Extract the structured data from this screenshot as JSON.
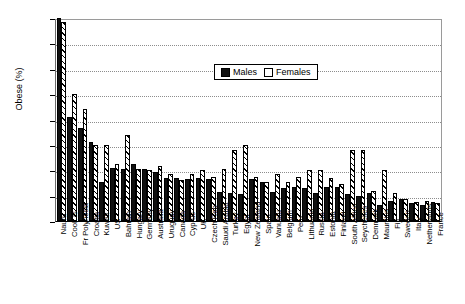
{
  "chart_data": {
    "type": "bar",
    "title": "",
    "xlabel": "",
    "ylabel": "Obese (%)",
    "ylim": [
      0,
      80
    ],
    "yticks": [
      0,
      10,
      20,
      30,
      40,
      50,
      60,
      70,
      80
    ],
    "grid": true,
    "legend_position": "top-center",
    "categories": [
      "Nauru",
      "Cook Is",
      "Fr Polynesia",
      "Croatia",
      "Kuwait",
      "US",
      "Bahrain",
      "Hungary",
      "Germany",
      "Australia",
      "Uruguay",
      "Canada",
      "Cyprus",
      "UK",
      "Czech Rep",
      "Saudi Arabia",
      "Turkey",
      "Egypt",
      "New Zealand",
      "Spain",
      "Vanuatu",
      "Belgium",
      "Peru",
      "Lithuania",
      "Russia",
      "Estonia",
      "Finland",
      "South Africa",
      "Seychelles",
      "Denmark",
      "Mauritius",
      "Fiji",
      "Sweden",
      "Italy",
      "Netherlands",
      "France"
    ],
    "series": [
      {
        "name": "Males",
        "color": "#111111",
        "values": [
          80.0,
          41.0,
          36.5,
          31.0,
          15.5,
          21.0,
          20.5,
          22.5,
          20.5,
          19.5,
          17.0,
          17.0,
          16.5,
          17.0,
          16.5,
          11.5,
          11.0,
          10.5,
          16.5,
          15.5,
          11.5,
          13.0,
          13.5,
          13.0,
          11.0,
          13.5,
          13.5,
          10.5,
          10.0,
          11.0,
          6.5,
          8.0,
          8.5,
          7.0,
          6.5,
          7.5
        ]
      },
      {
        "name": "Females",
        "color": "#ffffff",
        "values": [
          78.5,
          50.0,
          44.0,
          30.0,
          30.0,
          22.5,
          34.0,
          20.5,
          20.0,
          21.5,
          18.5,
          16.0,
          18.5,
          20.0,
          17.5,
          20.5,
          28.0,
          30.0,
          17.5,
          15.5,
          18.5,
          15.5,
          17.5,
          20.0,
          20.0,
          17.0,
          14.5,
          28.0,
          28.0,
          12.0,
          20.0,
          11.0,
          8.5,
          7.5,
          8.0,
          7.0
        ]
      }
    ]
  },
  "legend": {
    "items": [
      {
        "label": "Males"
      },
      {
        "label": "Females"
      }
    ]
  }
}
